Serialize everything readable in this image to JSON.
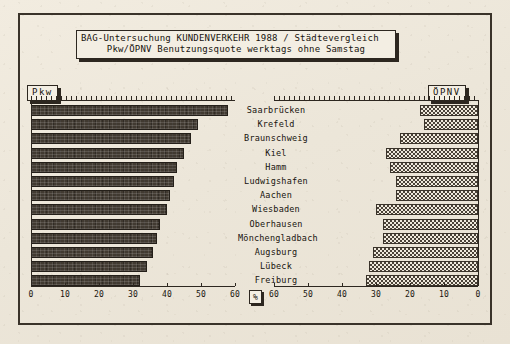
{
  "title": {
    "line1": "BAG-Untersuchung KUNDENVERKEHR 1988 / Städtevergleich",
    "line2": "Pkw/ÖPNV Benutzungsquote werktags ohne Samstag"
  },
  "legend": {
    "left_label": "Pkw",
    "right_label": "ÖPNV"
  },
  "axis": {
    "unit_marker": "%",
    "left_ticks": [
      "0",
      "10",
      "20",
      "30",
      "40",
      "50",
      "60"
    ],
    "right_ticks": [
      "60",
      "50",
      "40",
      "30",
      "20",
      "10",
      "0"
    ]
  },
  "colors": {
    "paper": "#efeade",
    "ink": "#2d2720",
    "bar_pkw": "#413a31",
    "bar_opnv": "#4a4238"
  },
  "chart_data": {
    "type": "bar",
    "title": "BAG-Untersuchung KUNDENVERKEHR 1988 / Städtevergleich",
    "subtitle": "Pkw/ÖPNV Benutzungsquote werktags ohne Samstag",
    "orientation": "horizontal",
    "layout": "back-to-back butterfly: Pkw grows rightward from left axis, ÖPNV grows leftward from right axis",
    "xlabel": "%",
    "ylabel": "",
    "xlim": [
      0,
      60
    ],
    "grid": false,
    "legend_position": "top-left and top-right",
    "categories": [
      "Saarbrücken",
      "Krefeld",
      "Braunschweig",
      "Kiel",
      "Hamm",
      "Ludwigshafen",
      "Aachen",
      "Wiesbaden",
      "Oberhausen",
      "Mönchengladbach",
      "Augsburg",
      "Lübeck",
      "Freiburg"
    ],
    "series": [
      {
        "name": "Pkw",
        "axis": "left",
        "values": [
          58,
          49,
          47,
          45,
          43,
          42,
          41,
          40,
          38,
          37,
          36,
          34,
          32
        ]
      },
      {
        "name": "ÖPNV",
        "axis": "right",
        "values": [
          17,
          16,
          23,
          27,
          26,
          24,
          24,
          30,
          28,
          28,
          31,
          32,
          33
        ]
      }
    ]
  }
}
